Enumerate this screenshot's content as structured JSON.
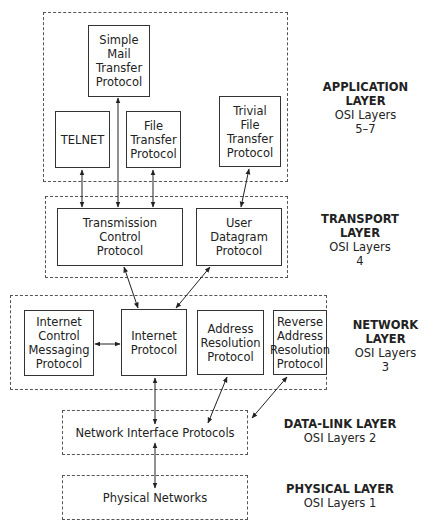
{
  "layers": {
    "application": {
      "title": "APPLICATION\nLAYER",
      "osi": "OSI Layers\n5–7"
    },
    "transport": {
      "title": "TRANSPORT\nLAYER",
      "osi": "OSI Layers\n4"
    },
    "network": {
      "title": "NETWORK\nLAYER",
      "osi": "OSI Layers\n3"
    },
    "datalink": {
      "title": "DATA-LINK LAYER",
      "osi": "OSI Layers 2"
    },
    "physical": {
      "title": "PHYSICAL LAYER",
      "osi": "OSI Layers 1"
    }
  },
  "protocols": {
    "smtp": "Simple\nMail\nTransfer\nProtocol",
    "telnet": "TELNET",
    "ftp": "File\nTransfer\nProtocol",
    "tftp": "Trivial\nFile\nTransfer\nProtocol",
    "tcp": "Transmission\nControl\nProtocol",
    "udp": "User\nDatagram\nProtocol",
    "icmp": "Internet\nControl\nMessaging\nProtocol",
    "ip": "Internet\nProtocol",
    "arp": "Address\nResolution\nProtocol",
    "rarp": "Reverse\nAddress\nResolution\nProtocol",
    "nip": "Network Interface Protocols",
    "phys": "Physical Networks"
  }
}
